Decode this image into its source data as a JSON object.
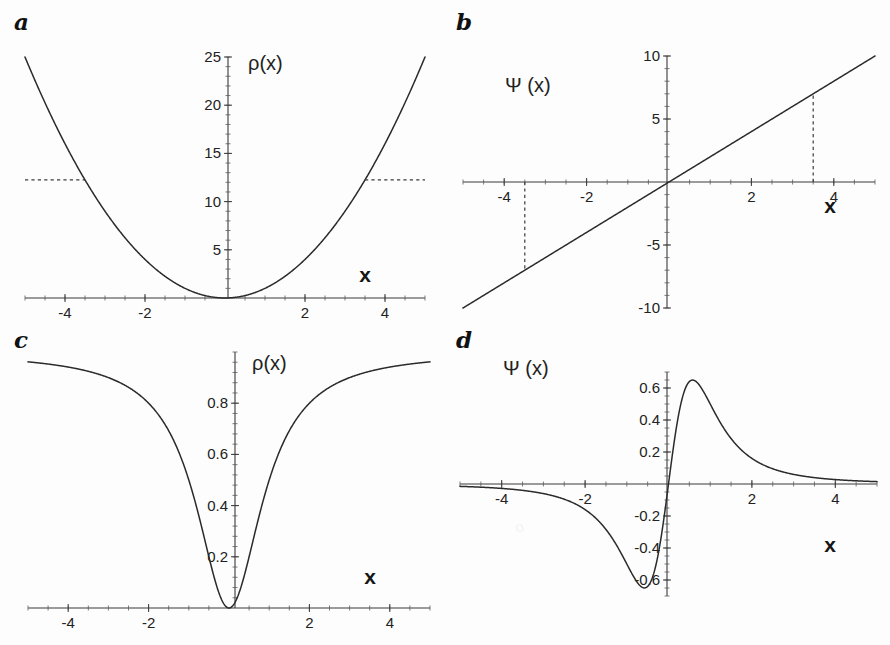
{
  "figure": {
    "background": "#fdfdfd",
    "curve_color": "#2b2b2b",
    "axis_color": "#3a3a3a",
    "panel_count": 4
  },
  "panels": {
    "a": {
      "letter": "a",
      "ylabel": "ρ(x)",
      "xlabel": "x"
    },
    "b": {
      "letter": "b",
      "ylabel": "Ψ (x)",
      "xlabel": "x"
    },
    "c": {
      "letter": "c",
      "ylabel": "ρ(x)",
      "xlabel": "x"
    },
    "d": {
      "letter": "d",
      "ylabel": "Ψ (x)",
      "xlabel": "x"
    }
  },
  "chart_data": [
    {
      "id": "a",
      "type": "line",
      "title": "",
      "panel_letter": "a",
      "xlabel": "x",
      "ylabel": "ρ(x)",
      "xlim": [
        -5,
        5
      ],
      "ylim": [
        0,
        25
      ],
      "grid": false,
      "legend": null,
      "xticks": [
        -4,
        -2,
        2,
        4
      ],
      "xticklabels": [
        "-4",
        "-2",
        "2",
        "4"
      ],
      "yticks": [
        5,
        10,
        15,
        20,
        25
      ],
      "yticklabels": [
        "5",
        "10",
        "15",
        "20",
        "25"
      ],
      "x_minor_step": 0.5,
      "y_minor_step": 1,
      "series": [
        {
          "name": "ρ(x) = x^2",
          "expression": "x*x",
          "x": [
            -5,
            -4.5,
            -4,
            -3.5,
            -3,
            -2.5,
            -2,
            -1.5,
            -1,
            -0.5,
            0,
            0.5,
            1,
            1.5,
            2,
            2.5,
            3,
            3.5,
            4,
            4.5,
            5
          ],
          "values": [
            25,
            20.25,
            16,
            12.25,
            9,
            6.25,
            4,
            2.25,
            1,
            0.25,
            0,
            0.25,
            1,
            2.25,
            4,
            6.25,
            9,
            12.25,
            16,
            20.25,
            25
          ]
        }
      ],
      "annotations": [
        {
          "kind": "dashed-horizontal-segment",
          "y": 12.25,
          "x_from": -5,
          "x_to": -3.5
        },
        {
          "kind": "dashed-horizontal-segment",
          "y": 12.25,
          "x_from": 3.5,
          "x_to": 5
        }
      ]
    },
    {
      "id": "b",
      "type": "line",
      "title": "",
      "panel_letter": "b",
      "xlabel": "x",
      "ylabel": "Ψ (x)",
      "xlim": [
        -5,
        5
      ],
      "ylim": [
        -10,
        10
      ],
      "grid": false,
      "legend": null,
      "xticks": [
        -4,
        -2,
        2,
        4
      ],
      "xticklabels": [
        "-4",
        "-2",
        "2",
        "4"
      ],
      "yticks": [
        -10,
        -5,
        5,
        10
      ],
      "yticklabels": [
        "-10",
        "-5",
        "5",
        "10"
      ],
      "x_minor_step": 0.5,
      "y_minor_step": 1,
      "series": [
        {
          "name": "Ψ(x) = 2x",
          "expression": "2*x",
          "x": [
            -5,
            -4,
            -3,
            -2,
            -1,
            0,
            1,
            2,
            3,
            4,
            5
          ],
          "values": [
            -10,
            -8,
            -6,
            -4,
            -2,
            0,
            2,
            4,
            6,
            8,
            10
          ]
        }
      ],
      "annotations": [
        {
          "kind": "dashed-vertical-segment",
          "x": -3.5,
          "y_from": 0,
          "y_to": -7
        },
        {
          "kind": "dashed-vertical-segment",
          "x": 3.5,
          "y_from": 0,
          "y_to": 7
        }
      ]
    },
    {
      "id": "c",
      "type": "line",
      "title": "",
      "panel_letter": "c",
      "xlabel": "x",
      "ylabel": "ρ(x)",
      "xlim": [
        -5,
        5
      ],
      "ylim": [
        0,
        1
      ],
      "grid": false,
      "legend": null,
      "xticks": [
        -4,
        -2,
        2,
        4
      ],
      "xticklabels": [
        "-4",
        "-2",
        "2",
        "4"
      ],
      "yticks": [
        0.2,
        0.4,
        0.6,
        0.8
      ],
      "yticklabels": [
        "0.2",
        "0.4",
        "0.6",
        "0.8"
      ],
      "x_minor_step": 0.5,
      "y_minor_step": 0.04,
      "series": [
        {
          "name": "ρ(x) = x^2/(1+x^2)",
          "expression": "x*x/(1+x*x)",
          "x": [
            -5,
            -4.5,
            -4,
            -3.5,
            -3,
            -2.5,
            -2,
            -1.5,
            -1,
            -0.75,
            -0.5,
            -0.25,
            0,
            0.25,
            0.5,
            0.75,
            1,
            1.5,
            2,
            2.5,
            3,
            3.5,
            4,
            4.5,
            5
          ],
          "values": [
            0.962,
            0.953,
            0.941,
            0.925,
            0.9,
            0.862,
            0.8,
            0.692,
            0.5,
            0.36,
            0.2,
            0.059,
            0,
            0.059,
            0.2,
            0.36,
            0.5,
            0.692,
            0.8,
            0.862,
            0.9,
            0.925,
            0.941,
            0.953,
            0.962
          ]
        }
      ],
      "annotations": []
    },
    {
      "id": "d",
      "type": "line",
      "title": "",
      "panel_letter": "d",
      "xlabel": "x",
      "ylabel": "Ψ (x)",
      "xlim": [
        -5,
        5
      ],
      "ylim": [
        -0.7,
        0.7
      ],
      "grid": false,
      "legend": null,
      "xticks": [
        -4,
        -2,
        2,
        4
      ],
      "xticklabels": [
        "-4",
        "-2",
        "2",
        "4"
      ],
      "yticks": [
        -0.6,
        -0.4,
        -0.2,
        0.2,
        0.4,
        0.6
      ],
      "yticklabels": [
        "-0.6",
        "-0.4",
        "-0.2",
        "0.2",
        "0.4",
        "0.6"
      ],
      "x_minor_step": 0.5,
      "y_minor_step": 0.05,
      "series": [
        {
          "name": "Ψ(x) = 2x/(1+x^2)^2",
          "expression": "2*x/((1+x*x)*(1+x*x))",
          "x": [
            -5,
            -4,
            -3,
            -2.5,
            -2,
            -1.5,
            -1.2,
            -1,
            -0.8,
            -0.6,
            -0.5,
            -0.4,
            -0.25,
            -0.1,
            0,
            0.1,
            0.25,
            0.4,
            0.5,
            0.6,
            0.8,
            1,
            1.2,
            1.5,
            2,
            2.5,
            3,
            4,
            5
          ],
          "values": [
            -0.0148,
            -0.0277,
            -0.06,
            -0.0942,
            -0.16,
            -0.2839,
            -0.3689,
            -0.5,
            -0.5606,
            -0.6489,
            -0.64,
            -0.6228,
            -0.4414,
            -0.1961,
            0,
            0.1961,
            0.4414,
            0.6228,
            0.64,
            0.6489,
            0.5606,
            0.5,
            0.3689,
            0.2839,
            0.16,
            0.0942,
            0.06,
            0.0277,
            0.0148
          ]
        }
      ],
      "annotations": []
    }
  ]
}
